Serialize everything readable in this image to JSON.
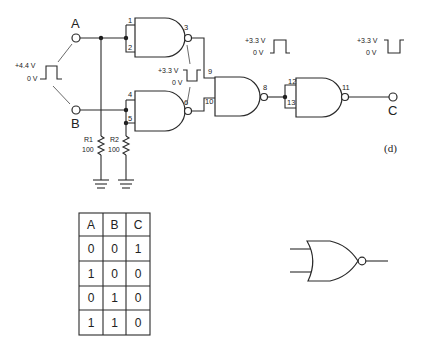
{
  "figure": {
    "label": "(d)"
  },
  "inputs": [
    {
      "name": "A"
    },
    {
      "name": "B"
    }
  ],
  "output": {
    "name": "C"
  },
  "input_pulse": {
    "high": "+4.4 V",
    "low": "0 V"
  },
  "mid_pulse": {
    "high": "+3.3 V",
    "low": "0 V"
  },
  "gate8_pulse": {
    "high": "+3.3 V",
    "low": "0 V"
  },
  "output_pulse": {
    "high": "+3.3 V",
    "low": "0 V"
  },
  "gates": [
    {
      "type": "NAND",
      "pins": [
        "1",
        "2",
        "3"
      ]
    },
    {
      "type": "NAND",
      "pins": [
        "4",
        "5",
        "6"
      ]
    },
    {
      "type": "NAND",
      "pins": [
        "9",
        "10",
        "8"
      ]
    },
    {
      "type": "NAND",
      "pins": [
        "12",
        "13",
        "11"
      ]
    }
  ],
  "resistors": [
    {
      "name": "R1",
      "value": "100"
    },
    {
      "name": "R2",
      "value": "100"
    }
  ],
  "truth_table": {
    "headers": [
      "A",
      "B",
      "C"
    ],
    "rows": [
      [
        "0",
        "0",
        "1"
      ],
      [
        "1",
        "0",
        "0"
      ],
      [
        "0",
        "1",
        "0"
      ],
      [
        "1",
        "1",
        "0"
      ]
    ]
  },
  "equivalent_symbol": "NOR gate"
}
